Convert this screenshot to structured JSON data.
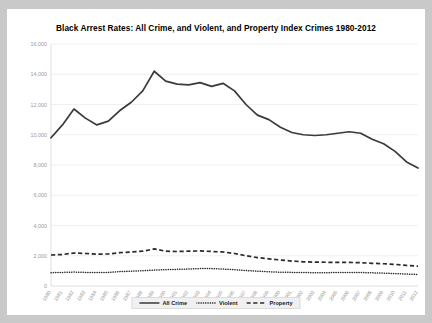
{
  "chart_data": {
    "type": "line",
    "title": "Black Arrest Rates: All Crime, and Violent, and Property Index Crimes 1980-2012",
    "xlabel": "",
    "ylabel": "",
    "ylim": [
      0,
      16000
    ],
    "ytick_labels": [
      "16,000",
      "14,000",
      "12,000",
      "10,000",
      "8,000",
      "6,000",
      "4,000",
      "2,000",
      "0"
    ],
    "ytick_values": [
      16000,
      14000,
      12000,
      10000,
      8000,
      6000,
      4000,
      2000,
      0
    ],
    "grid": true,
    "legend_position": "bottom",
    "categories": [
      "1980",
      "1981",
      "1982",
      "1983",
      "1984",
      "1985",
      "1986",
      "1987",
      "1988",
      "1989",
      "1990",
      "1991",
      "1992",
      "1993",
      "1994",
      "1995",
      "1996",
      "1997",
      "1998",
      "1999",
      "2000",
      "2001",
      "2002",
      "2003",
      "2004",
      "2005",
      "2006",
      "2007",
      "2008",
      "2009",
      "2010",
      "2011",
      "2012"
    ],
    "series": [
      {
        "name": "All Crime",
        "style": "solid",
        "values": [
          9800,
          10650,
          11700,
          11100,
          10650,
          10900,
          11600,
          12150,
          12900,
          14200,
          13550,
          13350,
          13300,
          13450,
          13200,
          13400,
          12900,
          12000,
          11300,
          11000,
          10500,
          10150,
          10000,
          9950,
          10000,
          10100,
          10200,
          10100,
          9700,
          9400,
          8900,
          8200,
          7800
        ]
      },
      {
        "name": "Violent",
        "style": "dotted",
        "values": [
          880,
          900,
          920,
          900,
          890,
          900,
          950,
          980,
          1010,
          1050,
          1080,
          1100,
          1120,
          1150,
          1150,
          1120,
          1080,
          1020,
          980,
          940,
          910,
          900,
          890,
          880,
          880,
          890,
          900,
          890,
          870,
          850,
          820,
          790,
          760
        ]
      },
      {
        "name": "Property",
        "style": "dashed",
        "values": [
          2050,
          2080,
          2180,
          2150,
          2100,
          2120,
          2200,
          2250,
          2300,
          2450,
          2300,
          2280,
          2300,
          2320,
          2280,
          2250,
          2150,
          2000,
          1880,
          1800,
          1720,
          1650,
          1600,
          1580,
          1570,
          1560,
          1560,
          1540,
          1500,
          1470,
          1430,
          1360,
          1310
        ]
      }
    ]
  },
  "legend": {
    "items": [
      {
        "label": "All Crime",
        "style": "solid"
      },
      {
        "label": "Violent",
        "style": "dotted"
      },
      {
        "label": "Property",
        "style": "dashed"
      }
    ]
  }
}
